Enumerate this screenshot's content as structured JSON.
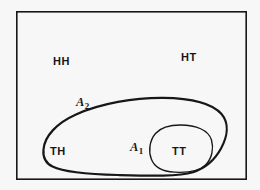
{
  "figure": {
    "kind": "euler-diagram",
    "background_color": "#f7f7f8",
    "stroke_color": "#17171a",
    "sample_space": {
      "name": "sample-space-rectangle",
      "outcomes": [
        "HH",
        "HT",
        "TH",
        "TT"
      ]
    },
    "outcome_labels": [
      {
        "id": "HH",
        "text": "HH",
        "x": 65,
        "y": 62
      },
      {
        "id": "HT",
        "text": "HT",
        "x": 193,
        "y": 58
      },
      {
        "id": "TH",
        "text": "TH",
        "x": 60,
        "y": 152
      },
      {
        "id": "TT",
        "text": "TT",
        "x": 180,
        "y": 152
      }
    ],
    "event_labels": [
      {
        "id": "A2",
        "base": "A",
        "subscript": "2",
        "text": "A2",
        "x": 85,
        "y": 103
      },
      {
        "id": "A1",
        "base": "A",
        "subscript": "1",
        "text": "A1",
        "x": 140,
        "y": 148
      }
    ],
    "regions": {
      "outer_rectangle": {
        "x": 16,
        "y": 11,
        "width": 231,
        "height": 169,
        "stroke_width": 1.6
      },
      "event_a2": {
        "label": "A2",
        "contains": [
          "TH",
          "TT"
        ],
        "stroke_width": 2.2
      },
      "event_a1": {
        "label": "A1",
        "contains": [
          "TT"
        ],
        "stroke_width": 1.35
      }
    },
    "relations": {
      "nesting": "A1 is a subset of A2",
      "outside_events": [
        "HH",
        "HT"
      ]
    }
  }
}
